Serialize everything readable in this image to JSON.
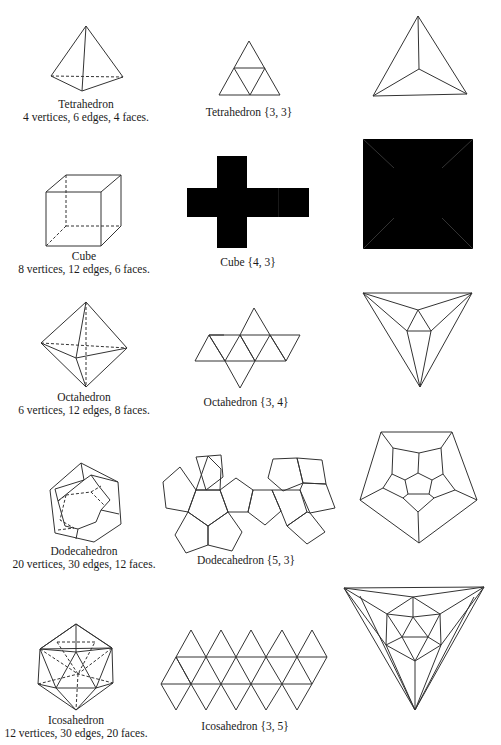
{
  "rows": [
    {
      "name": "Tetrahedron",
      "counts": "4 vertices, 6 edges, 4 faces.",
      "net_label": "Tetrahedron {3, 3}"
    },
    {
      "name": "Cube",
      "counts": "8 vertices, 12 edges, 6 faces.",
      "net_label": "Cube {4, 3}"
    },
    {
      "name": "Octahedron",
      "counts": "6 vertices, 12 edges, 8 faces.",
      "net_label": "Octahedron {3, 4}"
    },
    {
      "name": "Dodecahedron",
      "counts": "20 vertices, 30 edges, 12 faces.",
      "net_label": "Dodecahedron {5, 3}"
    },
    {
      "name": "Icosahedron",
      "counts": "12 vertices, 30 edges, 20 faces.",
      "net_label": "Icosahedron {3, 5}"
    }
  ],
  "columns": [
    "3D view",
    "Net",
    "Schlegel diagram"
  ],
  "colors": {
    "line": "#333333",
    "background": "#ffffff",
    "text": "#1a1a1a"
  }
}
